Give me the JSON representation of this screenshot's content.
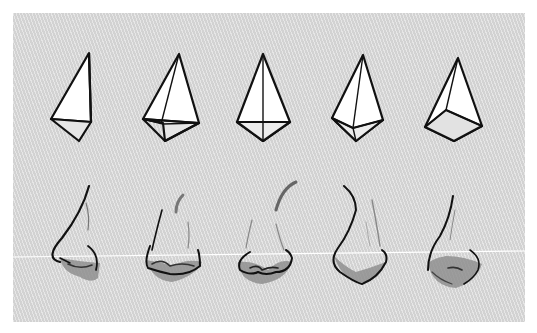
{
  "illustration": {
    "subject": "Pyramid construction forms and corresponding nose drawings",
    "background_color": "#d9d9d9",
    "line_color": "#111111",
    "shadow_color": "#8a8a8a",
    "guide_line_color": "#ffffff",
    "pyramids": [
      {
        "id": 1,
        "view": "three-quarter left, tall"
      },
      {
        "id": 2,
        "view": "three-quarter left"
      },
      {
        "id": 3,
        "view": "front"
      },
      {
        "id": 4,
        "view": "front tilted"
      },
      {
        "id": 5,
        "view": "from below"
      }
    ],
    "noses": [
      {
        "id": 1,
        "view": "profile"
      },
      {
        "id": 2,
        "view": "three-quarter"
      },
      {
        "id": 3,
        "view": "front"
      },
      {
        "id": 4,
        "view": "front tilted"
      },
      {
        "id": 5,
        "view": "from below"
      }
    ]
  }
}
